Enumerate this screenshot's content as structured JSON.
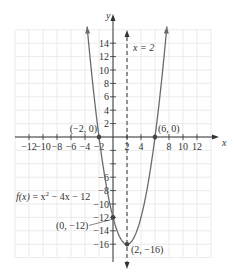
{
  "chart_data": {
    "type": "line",
    "title": "",
    "function_label": "f(x) = x² − 4x − 12",
    "function_label_parts": {
      "fx": "f(x)",
      "eq": " = x",
      "sup": "2",
      "rest": " − 4x − 12"
    },
    "xlabel": "x",
    "ylabel": "y",
    "xlim": [
      -14,
      14
    ],
    "ylim": [
      -18,
      16
    ],
    "grid": true,
    "x_ticks": [
      -12,
      -10,
      -8,
      -6,
      -4,
      -2,
      2,
      4,
      8,
      10,
      12
    ],
    "x_tick_labels": [
      "−12",
      "−10",
      "−8",
      "−6",
      "−4",
      "−2",
      "2",
      "4",
      "8",
      "10",
      "12"
    ],
    "y_ticks_pos": [
      2,
      4,
      6,
      8,
      10,
      12,
      14
    ],
    "y_ticks_neg": [
      -6,
      -8,
      -10,
      -12,
      -14,
      -16
    ],
    "y_tick_labels_pos": [
      "2",
      "4",
      "6",
      "8",
      "10",
      "12",
      "14"
    ],
    "y_tick_labels_neg": [
      "−6",
      "−8",
      "−10",
      "−12",
      "−14",
      "−16"
    ],
    "series": [
      {
        "name": "f(x) = x^2 - 4x - 12",
        "a": 1,
        "b": -4,
        "c": -12,
        "x_range": [
          -3.7,
          7.7
        ]
      }
    ],
    "axis_of_symmetry": {
      "x": 2,
      "label": "x = 2"
    },
    "points": [
      {
        "x": -2,
        "y": 0,
        "label": "(−2, 0)"
      },
      {
        "x": 6,
        "y": 0,
        "label": "(6, 0)"
      },
      {
        "x": 0,
        "y": -12,
        "label": "(0, −12)"
      },
      {
        "x": 2,
        "y": -16,
        "label": "(2, −16)"
      }
    ]
  },
  "colors": {
    "curve": "#6b6b6b",
    "axis": "#333333",
    "grid": "#e6e6e6",
    "point": "#444444"
  }
}
